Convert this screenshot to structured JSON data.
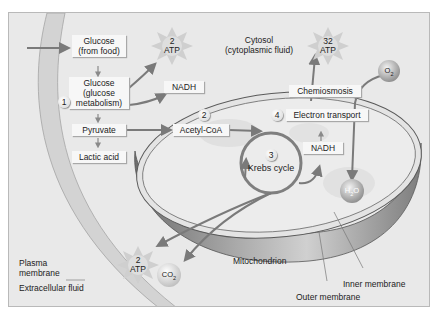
{
  "diagram": {
    "regions": {
      "cytosol": "Cytosol",
      "cytosol_sub": "(cytoplasmic fluid)",
      "extracellular": "Extracellular fluid",
      "plasma_membrane_line1": "Plasma",
      "plasma_membrane_line2": "membrane",
      "mitochondrion": "Mitochondrion",
      "inner_membrane": "Inner membrane",
      "outer_membrane": "Outer membrane"
    },
    "glycolysis": {
      "step": "1",
      "glucose_food_line1": "Glucose",
      "glucose_food_line2": "(from food)",
      "glucose_met_line1": "Glucose",
      "glucose_met_line2": "(glucose",
      "glucose_met_line3": "metabolism)",
      "pyruvate": "Pyruvate",
      "lactic_acid": "Lactic acid",
      "nadh": "NADH",
      "atp_count": "2",
      "atp_label": "ATP"
    },
    "acetyl": {
      "step": "2",
      "label": "Acetyl-CoA"
    },
    "krebs": {
      "step": "3",
      "label": "Krebs cycle",
      "nadh": "NADH",
      "atp_count": "2",
      "atp_label": "ATP",
      "co2": "CO",
      "co2_sub": "2"
    },
    "electron_transport": {
      "step": "4",
      "label": "Electron transport",
      "chemiosmosis": "Chemiosmosis",
      "atp_count": "32",
      "atp_label": "ATP",
      "o2": "O",
      "o2_sub": "2",
      "h2o_h": "H",
      "h2o_sub": "2",
      "h2o_o": "O"
    },
    "colors": {
      "background": "#e9e9e9",
      "box": "#f7f7f7",
      "arrow": "#7a7a7a",
      "membrane_light": "#d6d6d6",
      "mito_dark": "#8f8f8f"
    }
  }
}
